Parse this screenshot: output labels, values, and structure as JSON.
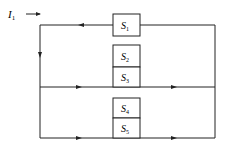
{
  "diagram": {
    "input_label": "I",
    "input_subscript": "1",
    "blocks": [
      {
        "name": "S",
        "sub": "1"
      },
      {
        "name": "S",
        "sub": "2"
      },
      {
        "name": "S",
        "sub": "3"
      },
      {
        "name": "S",
        "sub": "4"
      },
      {
        "name": "S",
        "sub": "5"
      }
    ],
    "colors": {
      "line": "#222222",
      "background": "#ffffff"
    }
  }
}
